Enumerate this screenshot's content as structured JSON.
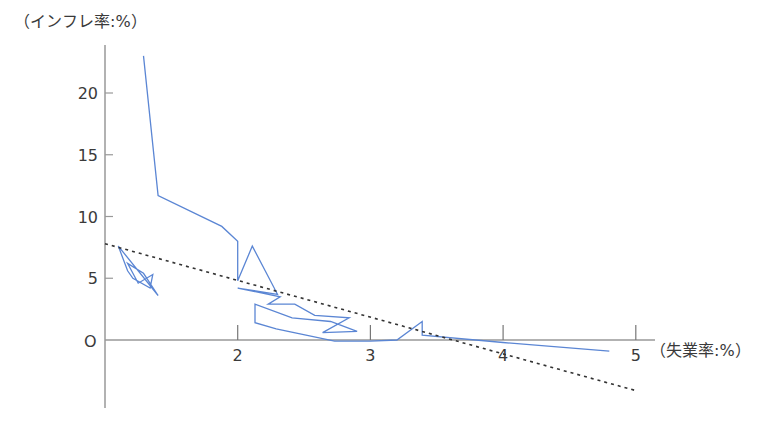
{
  "chart_data": {
    "type": "line",
    "title": "",
    "xlabel": "（失業率:%）",
    "ylabel": "（インフレ率:%）",
    "x_ticks": [
      "2",
      "3",
      "4",
      "5"
    ],
    "y_ticks": [
      "5",
      "10",
      "15",
      "20"
    ],
    "origin_label": "O",
    "xlim": [
      1,
      5.1
    ],
    "ylim": [
      -5.5,
      23.5
    ],
    "grid": false,
    "series": [
      {
        "name": "Phillips curve path",
        "color": "#5b86d4",
        "points": [
          [
            1.29,
            23.0
          ],
          [
            1.4,
            11.7
          ],
          [
            1.88,
            9.2
          ],
          [
            2.0,
            8.0
          ],
          [
            2.0,
            4.8
          ],
          [
            2.11,
            7.6
          ],
          [
            2.3,
            3.7
          ],
          [
            2.0,
            4.2
          ],
          [
            2.32,
            3.5
          ],
          [
            2.23,
            2.9
          ],
          [
            2.43,
            2.9
          ],
          [
            2.58,
            2.0
          ],
          [
            2.84,
            1.8
          ],
          [
            2.64,
            0.6
          ],
          [
            2.9,
            0.7
          ],
          [
            2.7,
            1.5
          ],
          [
            2.41,
            1.8
          ],
          [
            2.13,
            2.9
          ],
          [
            2.13,
            1.4
          ],
          [
            2.29,
            0.9
          ],
          [
            2.73,
            -0.1
          ],
          [
            3.0,
            -0.1
          ],
          [
            3.2,
            0.0
          ],
          [
            3.39,
            1.5
          ],
          [
            3.39,
            0.4
          ],
          [
            4.0,
            -0.2
          ],
          [
            4.8,
            -0.9
          ]
        ]
      },
      {
        "name": "Early cluster",
        "color": "#5b86d4",
        "points": [
          [
            1.1,
            7.6
          ],
          [
            1.4,
            3.6
          ],
          [
            1.29,
            5.4
          ],
          [
            1.17,
            6.2
          ],
          [
            1.25,
            4.6
          ],
          [
            1.36,
            5.3
          ],
          [
            1.34,
            4.2
          ],
          [
            1.21,
            5.0
          ],
          [
            1.17,
            5.6
          ],
          [
            1.1,
            7.6
          ]
        ]
      },
      {
        "name": "Trend line",
        "style": "dashed",
        "color": "#333333",
        "points": [
          [
            1.0,
            7.8
          ],
          [
            5.0,
            -4.1
          ]
        ]
      }
    ]
  }
}
